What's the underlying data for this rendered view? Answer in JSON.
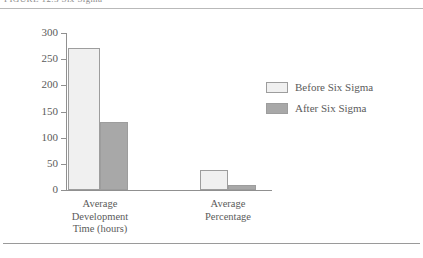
{
  "figure": {
    "title": "FIGURE 12.3  Six Sigma",
    "top_rule": true,
    "bottom_rule": true
  },
  "colors": {
    "before_fill": "#f0f0f0",
    "after_fill": "#a8a8a8",
    "bar_border": "#9d9d9d",
    "axis": "#909090",
    "text": "#5b5b5b",
    "rule": "#b9b9b9"
  },
  "legend": {
    "position": "right",
    "items": [
      {
        "label": "Before Six Sigma",
        "color": "#f0f0f0"
      },
      {
        "label": "After Six Sigma",
        "color": "#a8a8a8"
      }
    ]
  },
  "chart_data": {
    "type": "bar",
    "title": "FIGURE 12.3  Six Sigma",
    "xlabel": "",
    "ylabel": "",
    "ylim": [
      0,
      300
    ],
    "yticks": [
      0,
      50,
      100,
      150,
      200,
      250,
      300
    ],
    "ytick_labels": [
      "0",
      "50",
      "100",
      "150",
      "200",
      "250",
      "300"
    ],
    "grid": false,
    "legend_position": "right",
    "categories": [
      "Average Development Time (hours)",
      "Average Percentage"
    ],
    "category_lines": [
      [
        "Average",
        "Development",
        "Time (hours)"
      ],
      [
        "Average",
        "Percentage"
      ]
    ],
    "series": [
      {
        "name": "Before Six Sigma",
        "color": "#f0f0f0",
        "values": [
          272,
          38
        ]
      },
      {
        "name": "After Six Sigma",
        "color": "#a8a8a8",
        "values": [
          130,
          10
        ]
      }
    ]
  }
}
